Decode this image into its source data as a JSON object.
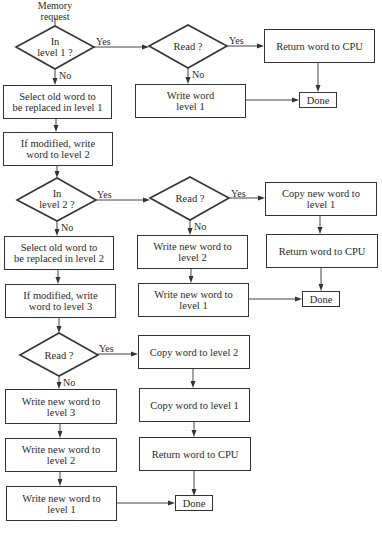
{
  "start": {
    "label_line1": "Memory",
    "label_line2": "request"
  },
  "labels": {
    "yes": "Yes",
    "no": "No"
  },
  "nodes": {
    "in_level1": {
      "line1": "In",
      "line2": "level 1 ?"
    },
    "read_1": {
      "text": "Read ?"
    },
    "return_cpu_1": {
      "text": "Return word to CPU"
    },
    "write_word_l1": {
      "line1": "Write word",
      "line2": "level 1"
    },
    "done_1": {
      "text": "Done"
    },
    "select_old_l1": {
      "line1": "Select old word to",
      "line2": "be replaced in level 1"
    },
    "if_modified_l2": {
      "line1": "If modified, write",
      "line2": "word to level 2"
    },
    "in_level2": {
      "line1": "In",
      "line2": "level 2 ?"
    },
    "read_2": {
      "text": "Read ?"
    },
    "copy_new_l1": {
      "line1": "Copy new word to",
      "line2": "level 1"
    },
    "return_cpu_2": {
      "text": "Return word to CPU"
    },
    "write_new_l2_mid": {
      "line1": "Write new word to",
      "line2": "level 2"
    },
    "write_new_l1_mid": {
      "line1": "Write new word to",
      "line2": "level 1"
    },
    "done_2": {
      "text": "Done"
    },
    "select_old_l2": {
      "line1": "Select old word to",
      "line2": "be replaced in level 2"
    },
    "if_modified_l3": {
      "line1": "If modified, write",
      "line2": "word to level 3"
    },
    "read_3": {
      "text": "Read ?"
    },
    "copy_word_l2": {
      "text": "Copy word to level 2"
    },
    "copy_word_l1": {
      "text": "Copy word to level 1"
    },
    "return_cpu_3": {
      "text": "Return word to CPU"
    },
    "write_new_l3": {
      "line1": "Write new word to",
      "line2": "level 3"
    },
    "write_new_l2_bot": {
      "line1": "Write new word to",
      "line2": "level 2"
    },
    "write_new_l1_bot": {
      "line1": "Write new word to",
      "line2": "level 1"
    },
    "done_3": {
      "text": "Done"
    }
  },
  "colors": {
    "stroke": "#333333",
    "background": "#ffffff",
    "text": "#2a2a2a"
  }
}
